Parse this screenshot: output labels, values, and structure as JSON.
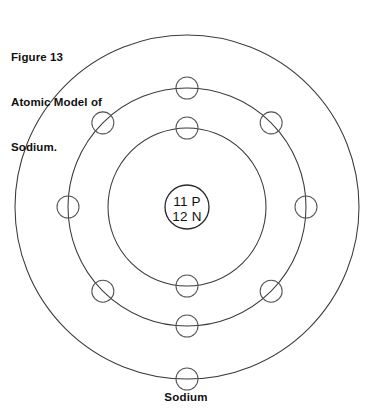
{
  "figure": {
    "title_lines": [
      "Figure 13",
      "Atomic Model of",
      "Sodium."
    ],
    "caption": "Sodium"
  },
  "nucleus": {
    "protons_label": "11 P",
    "neutrons_label": "12 N",
    "proton_count": 11,
    "neutron_count": 12,
    "center_x": 187,
    "center_y": 207,
    "radius": 22
  },
  "shells": [
    {
      "name": "inner-shell",
      "index": 1,
      "radius": 79,
      "electron_count": 2,
      "electron_angles_deg": [
        270,
        90
      ]
    },
    {
      "name": "middle-shell",
      "index": 2,
      "radius": 119,
      "electron_count": 8,
      "electron_angles_deg": [
        270,
        315,
        0,
        45,
        90,
        135,
        180,
        225
      ]
    },
    {
      "name": "outer-shell",
      "index": 3,
      "radius": 172,
      "electron_count": 1,
      "electron_angles_deg": [
        90
      ]
    }
  ],
  "electron": {
    "radius": 11
  },
  "colors": {
    "background": "#ffffff",
    "shell_stroke": "#3b3b3f",
    "electron_stroke": "#55555b",
    "nucleus_stroke": "#2a2a2e",
    "text": "#111111"
  }
}
